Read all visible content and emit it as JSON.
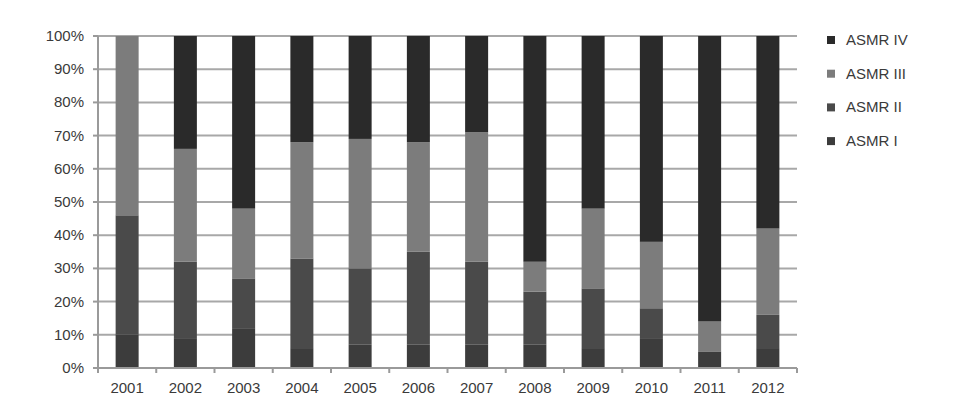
{
  "chart_data": {
    "type": "bar",
    "stacked": true,
    "normalized": true,
    "title": "",
    "xlabel": "",
    "ylabel": "",
    "ylim": [
      0,
      100
    ],
    "grid": true,
    "legend_position": "right",
    "categories": [
      "2001",
      "2002",
      "2003",
      "2004",
      "2005",
      "2006",
      "2007",
      "2008",
      "2009",
      "2010",
      "2011",
      "2012"
    ],
    "y_ticks": [
      "0%",
      "10%",
      "20%",
      "30%",
      "40%",
      "50%",
      "60%",
      "70%",
      "80%",
      "90%",
      "100%"
    ],
    "series": [
      {
        "name": "ASMR I",
        "color": "#3c3c3c",
        "values": [
          10,
          9,
          12,
          6,
          7,
          7,
          7,
          7,
          6,
          9,
          5,
          6
        ]
      },
      {
        "name": "ASMR II",
        "color": "#4a4a4a",
        "values": [
          36,
          23,
          15,
          27,
          23,
          28,
          25,
          16,
          18,
          9,
          0,
          10
        ]
      },
      {
        "name": "ASMR III",
        "color": "#7c7c7c",
        "values": [
          54,
          34,
          21,
          35,
          39,
          33,
          39,
          9,
          24,
          20,
          9,
          26
        ]
      },
      {
        "name": "ASMR IV",
        "color": "#2a2a2a",
        "values": [
          0,
          34,
          52,
          32,
          31,
          32,
          29,
          68,
          52,
          62,
          86,
          58
        ]
      }
    ],
    "legend": [
      "ASMR IV",
      "ASMR III",
      "ASMR II",
      "ASMR I"
    ]
  }
}
